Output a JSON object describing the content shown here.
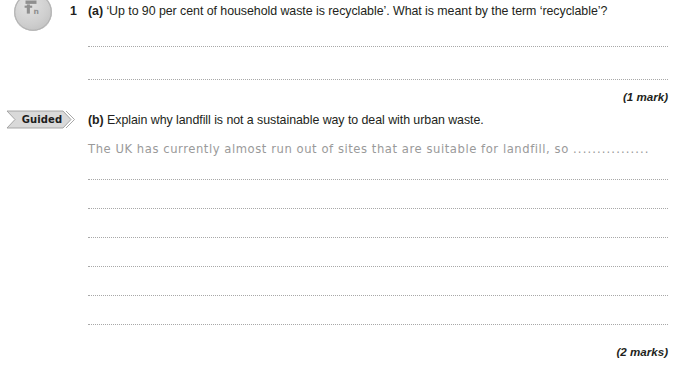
{
  "page": {
    "background_color": "#ffffff",
    "text_color": "#231f20",
    "rule_color": "#a8a8a8"
  },
  "badge": {
    "icon_name": "skill-badge-icon",
    "color": "#cfcfcf"
  },
  "guided": {
    "label": "Guided",
    "fill_color": "#d6d6d6",
    "icon_name": "guided-chevron-banner"
  },
  "question": {
    "number": "1",
    "parts": [
      {
        "letter": "(a)",
        "text": "‘Up to 90 per cent of household waste is recyclable’. What is meant by the term ‘recyclable’?",
        "answer_lines": 2,
        "marks": "(1 mark)"
      },
      {
        "letter": "(b)",
        "text": "Explain why landfill is not a sustainable way to deal with urban waste.",
        "guided_answer": "The UK has currently almost run out of sites that are suitable for landfill, so",
        "guided_answer_trailing_dots": "................",
        "answer_lines": 6,
        "marks": "(2 marks)"
      }
    ]
  }
}
